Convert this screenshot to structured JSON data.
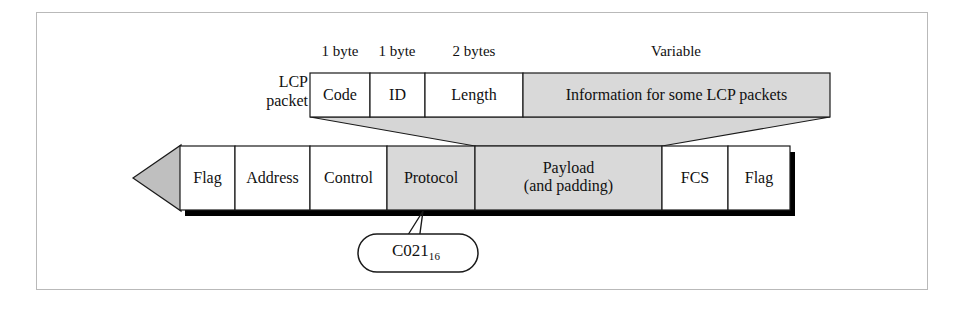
{
  "figure": {
    "colors": {
      "shaded_fill": "#d9d9d9",
      "connector_fill": "#d6d6d6",
      "arrow_fill": "#bfbfbf",
      "outline": "#1a1a1a",
      "frame_border": "#b9b9b9",
      "shadow": "#000000",
      "background": "#ffffff"
    }
  },
  "lcp_packet": {
    "row_label": "LCP\npacket",
    "row_label_line1": "LCP",
    "row_label_line2": "packet",
    "size_labels": [
      {
        "text": "1 byte",
        "center_x": 340
      },
      {
        "text": "1 byte",
        "center_x": 397
      },
      {
        "text": "2 bytes",
        "center_x": 474
      },
      {
        "text": "Variable",
        "center_x": 676
      }
    ],
    "fields": [
      {
        "name": "Code",
        "label": "Code",
        "x": 310,
        "width": 60,
        "shaded": false
      },
      {
        "name": "ID",
        "label": "ID",
        "x": 370,
        "width": 55,
        "shaded": false
      },
      {
        "name": "Length",
        "label": "Length",
        "x": 425,
        "width": 98,
        "shaded": false
      },
      {
        "name": "Information",
        "label": "Information for some LCP packets",
        "x": 523,
        "width": 307,
        "shaded": true
      }
    ],
    "row_top": 73,
    "row_height": 44
  },
  "ppp_frame": {
    "direction_arrow": "left",
    "fields": [
      {
        "name": "Flag",
        "label": "Flag",
        "x": 180,
        "width": 55,
        "shaded": false,
        "lines": [
          "Flag"
        ]
      },
      {
        "name": "Address",
        "label": "Address",
        "x": 235,
        "width": 75,
        "shaded": false,
        "lines": [
          "Address"
        ]
      },
      {
        "name": "Control",
        "label": "Control",
        "x": 310,
        "width": 77,
        "shaded": false,
        "lines": [
          "Control"
        ]
      },
      {
        "name": "Protocol",
        "label": "Protocol",
        "x": 387,
        "width": 88,
        "shaded": true,
        "lines": [
          "Protocol"
        ]
      },
      {
        "name": "Payload",
        "label": "Payload (and padding)",
        "x": 475,
        "width": 187,
        "shaded": true,
        "lines": [
          "Payload",
          "(and padding)"
        ]
      },
      {
        "name": "FCS",
        "label": "FCS",
        "x": 662,
        "width": 66,
        "shaded": false,
        "lines": [
          "FCS"
        ]
      },
      {
        "name": "Flag2",
        "label": "Flag",
        "x": 728,
        "width": 62,
        "shaded": false,
        "lines": [
          "Flag"
        ]
      }
    ],
    "row_top": 146,
    "row_height": 64
  },
  "callout": {
    "value": "C021",
    "subscript": "16",
    "full_text": "C021 base 16",
    "points_to": "Protocol"
  }
}
